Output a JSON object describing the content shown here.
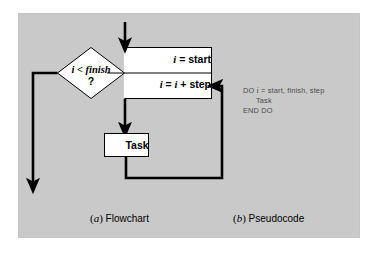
{
  "figure": {
    "background_color": "#ffffff",
    "panel_color": "#c9c9c9",
    "stroke_color": "#000000",
    "shape_fill": "#ffffff",
    "pseudocode_color": "#4a4a4a"
  },
  "flowchart": {
    "condition": {
      "expression": "i < finish",
      "question_mark": "?"
    },
    "init_row": {
      "text_var": "i",
      "text_rest": " = start"
    },
    "increment_row": {
      "text_var": "i",
      "text_mid": " = ",
      "text_var2": "i",
      "text_rest": " + step"
    },
    "task_box": {
      "label": "Task"
    },
    "arrows": {
      "entry": "down-arrow-into-loop-header",
      "exit": "left-then-down-exit-arrow",
      "body": "down-arrow-to-task",
      "return": "loop-back-arrow-to-increment"
    }
  },
  "pseudocode": {
    "lines": [
      {
        "prefix": "DO ",
        "var": "i",
        "rest": " = start, finish, step",
        "indent": false
      },
      {
        "prefix": "",
        "var": "",
        "rest": "Task",
        "indent": true
      },
      {
        "prefix": "",
        "var": "",
        "rest": "END DO",
        "indent": false
      }
    ]
  },
  "captions": {
    "a_letter": "a",
    "a_text": " Flowchart",
    "b_letter": "b",
    "b_text": " Pseudocode"
  }
}
